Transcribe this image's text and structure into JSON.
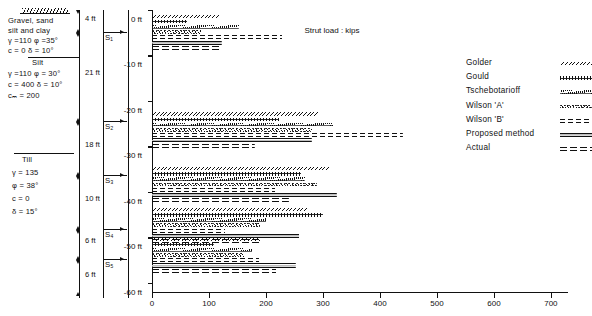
{
  "soil_profile": {
    "ground_label": "ground-surface-hatch",
    "layers": [
      {
        "name": "Gravel, sand silt and clay",
        "line1": "Gravel, sand",
        "line2": "silt and clay",
        "props1": "γ =110  φ =35°",
        "props2": "c = 0      δ = 10°"
      },
      {
        "name": "Silt",
        "line1": "Silt",
        "props1": "γ =110  φ = 30°",
        "props2": "c = 400  δ = 10°",
        "props3": "cₘ = 200"
      },
      {
        "name": "Till",
        "line1": "Till",
        "props1": "γ = 135",
        "props2": "φ = 38°",
        "props3": "c = 0",
        "props4": "δ = 15°"
      }
    ],
    "dimensions": [
      "4 ft",
      "21 ft",
      "18 ft",
      "10 ft",
      "6 ft",
      "6 ft"
    ],
    "struts": [
      "S₁",
      "S₂",
      "S₃",
      "S₄",
      "S₅"
    ]
  },
  "chart_data": {
    "type": "bar",
    "orientation": "horizontal",
    "title": "",
    "xlabel": "Strut load : kips",
    "ylabel": "",
    "xlim": [
      0,
      730
    ],
    "ylim": [
      -62,
      0
    ],
    "xticks": [
      0,
      100,
      200,
      300,
      400,
      500,
      600,
      700
    ],
    "xticklabels": [
      "0",
      "100",
      "200",
      "300",
      "400",
      "500",
      "600",
      "700"
    ],
    "yticks": [
      0,
      -10,
      -20,
      -30,
      -40,
      -50,
      -60
    ],
    "yticklabels": [
      "0 ft",
      "-10 ft",
      "-20 ft",
      "-30 ft",
      "-40 ft",
      "-50 ft",
      "-60 ft"
    ],
    "grid": false,
    "legend_position": "right",
    "categories": [
      "S1",
      "S2",
      "S3",
      "S4",
      "S5"
    ],
    "group_depths_ft": [
      -5.0,
      -26.5,
      -38.5,
      -47.5,
      -54.0
    ],
    "series": [
      {
        "name": "Golder",
        "values": [
          118,
          292,
          310,
          272,
          190
        ]
      },
      {
        "name": "Gould",
        "values": [
          62,
          222,
          262,
          300,
          108
        ]
      },
      {
        "name": "Tschebotarioff",
        "values": [
          152,
          318,
          268,
          200,
          176
        ]
      },
      {
        "name": "Wilson 'A'",
        "values": [
          86,
          280,
          290,
          190,
          162
        ]
      },
      {
        "name": "Wilson 'B'",
        "values": [
          228,
          440,
          216,
          128,
          188
        ]
      },
      {
        "name": "Proposed method",
        "values": [
          122,
          280,
          324,
          258,
          252
        ]
      },
      {
        "name": "Actual",
        "values": [
          118,
          180,
          240,
          188,
          218
        ]
      }
    ]
  },
  "legend": {
    "items": [
      {
        "label": "Golder",
        "style": "s-golder"
      },
      {
        "label": "Gould",
        "style": "s-gould"
      },
      {
        "label": "Tschebotarioff",
        "style": "s-tscheb"
      },
      {
        "label": "Wilson 'A'",
        "style": "s-wilsonA"
      },
      {
        "label": "Wilson 'B'",
        "style": "s-wilsonB"
      },
      {
        "label": "Proposed method",
        "style": "s-proposed"
      },
      {
        "label": "Actual",
        "style": "s-actual"
      }
    ]
  }
}
